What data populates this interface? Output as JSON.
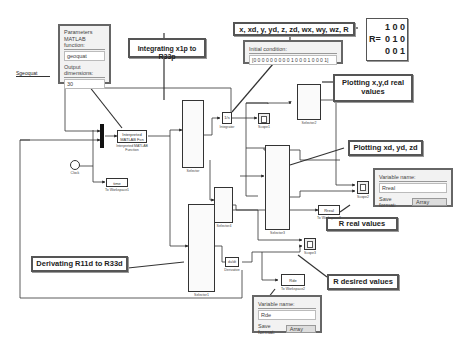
{
  "model": {
    "port_label": "Sgeoquat"
  },
  "parameters_dialog": {
    "title": "Parameters",
    "function_label": "MATLAB function:",
    "function_value": "geoquat",
    "output_dims_label": "Output dimensions:",
    "output_dims_value": "30"
  },
  "initial_condition_dialog": {
    "label": "Initial condition:",
    "value": "[0 0 0 0 0 0 0 0 0 1 0 0 0 1 0 0 0 1]"
  },
  "real_dialog": {
    "var_label": "Variable name:",
    "var_value": "Rreal",
    "format_label": "Save format:",
    "format_value": "Array"
  },
  "desired_dialog": {
    "var_label": "Variable name:",
    "var_value": "Rde",
    "format_label": "Save format:",
    "format_value": "Array"
  },
  "callouts": {
    "integrating": "Integrating x1p to R33p",
    "state_vector": "x, xd, y, yd, z, zd, wx, wy, wz, R",
    "plot_real": "Plotting x,y,d real values",
    "plot_desired": "Plotting xd, yd, zd",
    "r_real": "R real values",
    "derivating": "Derivating R11d to R33d",
    "r_desired": "R desired values"
  },
  "matrix": {
    "prefix": "R=",
    "rows": [
      "1 0 0",
      "0 1 0",
      "0 0 1"
    ]
  },
  "blocks": {
    "interp_fn": {
      "text": "Interpreted MATLAB Fcn",
      "label": "Interpreted MATLAB Function"
    },
    "clock": {
      "label": "Clock"
    },
    "time_ws": {
      "text": "time",
      "label": "To Workspace1"
    },
    "selector": {
      "label": "Selector"
    },
    "integrator": {
      "text": "1/s",
      "label": "Integrator"
    },
    "scope1": {
      "label": "Scope1"
    },
    "selector2": {
      "label": "Selector2"
    },
    "scope2": {
      "label": "Scope2"
    },
    "selector3": {
      "label": "Selector3"
    },
    "selector4": {
      "label": "Selector4"
    },
    "rreal_ws": {
      "text": "Rreal",
      "label": "To Workspace3"
    },
    "scope3": {
      "label": "Scope3"
    },
    "selector1": {
      "label": "Selector1"
    },
    "derivative": {
      "text": "du/dt",
      "label": "Derivative"
    },
    "rde_ws": {
      "text": "Rde",
      "label": "To Workspace2"
    }
  },
  "colors": {
    "line": "#333333",
    "callout_border": "#555555",
    "dialog_bg": "#f2f2f2"
  }
}
